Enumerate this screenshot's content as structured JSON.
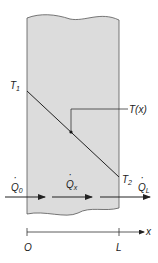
{
  "diagram": {
    "colors": {
      "slab_fill": "#dcdcdc",
      "stroke": "#333333",
      "text": "#222222"
    },
    "slab": {
      "left_x": 27,
      "right_x": 119
    },
    "temperature_profile": {
      "start_label": "T",
      "start_sub": "1",
      "end_label": "T",
      "end_sub": "2",
      "point_label": "T(x)"
    },
    "heat_flows": [
      {
        "id": "q0",
        "symbol": "Q",
        "sub": "0",
        "dot": "·"
      },
      {
        "id": "qx",
        "symbol": "Q",
        "sub": "x",
        "dot": "·"
      },
      {
        "id": "qL",
        "symbol": "Q",
        "sub": "L",
        "dot": "·"
      }
    ],
    "axis": {
      "origin_label": "O",
      "end_label": "L",
      "axis_label": "x"
    }
  }
}
